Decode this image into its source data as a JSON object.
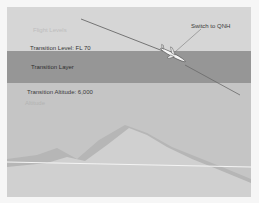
{
  "diagram": {
    "labels": {
      "flight_levels": "Flight Levels",
      "transition_level": "Transition Level: FL 70",
      "transition_layer": "Transition Layer",
      "transition_altitude": "Transition Altitude: 6,000",
      "altitude": "Altitude",
      "switch_to_qnh": "Switch to QNH"
    },
    "icons": {
      "aircraft": "airplane-icon"
    },
    "colors": {
      "flight_levels_band": "#d6d6d6",
      "transition_layer_band": "#969696",
      "altitude_band": "#c5c5c5",
      "terrain": "#b9b9b9",
      "terrain_light": "#d2d2d2",
      "flight_path": "#555555",
      "reference_line": "#f2f2f2"
    }
  }
}
